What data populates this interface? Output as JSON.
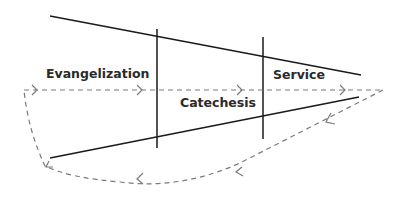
{
  "diagram": {
    "labels": {
      "evangelization": "Evangelization",
      "catechesis": "Catechesis",
      "service": "Service"
    },
    "colors": {
      "solid_line": "#1a1a1a",
      "dashed_line": "#7a7a7a",
      "text": "#2a2a2a"
    }
  }
}
